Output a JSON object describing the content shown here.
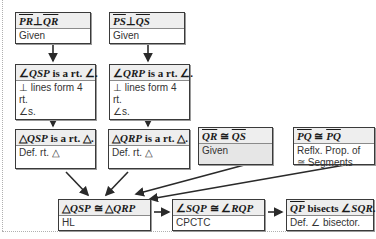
{
  "diagram": {
    "type": "flow-proof",
    "header_fragment": "Flow Proof:",
    "boxes": [
      {
        "id": "b1",
        "statement_a": "PR",
        "statement_op": "⊥",
        "statement_b": "QR",
        "reason": "Given"
      },
      {
        "id": "b2",
        "statement_a": "PS",
        "statement_op": "⊥",
        "statement_b": "QS",
        "reason": "Given"
      },
      {
        "id": "b3",
        "statement_pre": "∠",
        "statement_it": "QSP",
        "statement_post": " is a rt. ∠.",
        "reason_l1": "⊥ lines form 4 rt.",
        "reason_l2": "∠s."
      },
      {
        "id": "b4",
        "statement_pre": "∠",
        "statement_it": "QRP",
        "statement_post": " is a rt. ∠.",
        "reason_l1": "⊥ lines  form 4 rt.",
        "reason_l2": "∠s."
      },
      {
        "id": "b5",
        "statement_pre": "△",
        "statement_it": "QSP",
        "statement_post": " is a rt. △.",
        "reason": "Def. rt. △"
      },
      {
        "id": "b6",
        "statement_pre": "△",
        "statement_it": "QRP",
        "statement_post": " is a rt. △.",
        "reason": "Def. rt. △"
      },
      {
        "id": "b7",
        "statement_a": "QR",
        "statement_op": " ≅ ",
        "statement_b": "QS",
        "reason": "Given"
      },
      {
        "id": "b8",
        "statement_a": "PQ",
        "statement_op": " ≅ ",
        "statement_b": "PQ",
        "reason_l1": "Reflx. Prop. of",
        "reason_l2": "≅ Segments"
      },
      {
        "id": "b9",
        "statement_pre": "△",
        "statement_it": "QSP",
        "statement_mid": " ≅ △",
        "statement_it2": "QRP",
        "reason": "HL"
      },
      {
        "id": "b10",
        "statement_pre": "∠",
        "statement_it": "SQP",
        "statement_mid": " ≅ ∠",
        "statement_it2": "RQP",
        "reason": "CPCTC"
      },
      {
        "id": "b11",
        "statement_a": "QP",
        "statement_mid": " bisects ∠",
        "statement_it2": "SQR",
        "statement_post": ".",
        "reason": "Def. ∠ bisector."
      }
    ],
    "edges": [
      [
        "b1",
        "b3"
      ],
      [
        "b2",
        "b4"
      ],
      [
        "b3",
        "b5"
      ],
      [
        "b4",
        "b6"
      ],
      [
        "b5",
        "b9"
      ],
      [
        "b6",
        "b9"
      ],
      [
        "b7",
        "b9"
      ],
      [
        "b8",
        "b9"
      ],
      [
        "b9",
        "b10"
      ],
      [
        "b10",
        "b11"
      ]
    ],
    "colors": {
      "border": "#3a3a3a",
      "statement_bg": "#eeeeee",
      "given_bg": "#e6e6e6",
      "arrow": "#2a2a2a"
    }
  }
}
